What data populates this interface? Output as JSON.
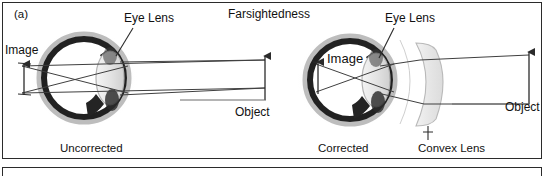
{
  "figure": {
    "panel_tag": "(a)",
    "title": "Farsightedness",
    "border_color": "#2b2b2b",
    "background": "#ffffff"
  },
  "left_diagram": {
    "name": "uncorrected-eye",
    "caption": "Uncorrected",
    "eye_lens_label": "Eye Lens",
    "image_label": "Image",
    "object_label": "Object"
  },
  "right_diagram": {
    "name": "corrected-eye",
    "caption": "Corrected",
    "eye_lens_label": "Eye Lens",
    "image_label": "Image",
    "object_label": "Object",
    "convex_lens_label": "Convex Lens"
  },
  "colors": {
    "ink": "#111111",
    "ray_line": "#3a3a3a",
    "eye_outline_dark": "#1f1f1f",
    "eye_shade_mid": "#9a9a9a",
    "eye_shade_light": "#d8d8d8",
    "lens_fill": "#e9e9e9",
    "glass_fill": "#ededed"
  }
}
